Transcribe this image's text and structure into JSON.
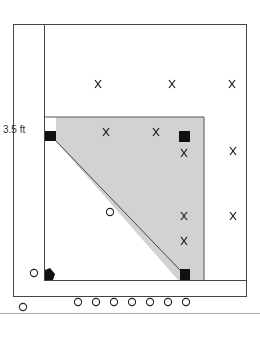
{
  "diagram": {
    "label": "3.5 ft",
    "colors": {
      "line": "#444444",
      "shade": "#d2d2d2",
      "marker": "#111111",
      "separator": "#aaaaaa"
    },
    "x_marks": [
      {
        "x": 98,
        "y": 84
      },
      {
        "x": 172,
        "y": 84
      },
      {
        "x": 232,
        "y": 84
      },
      {
        "x": 106,
        "y": 132
      },
      {
        "x": 156,
        "y": 132
      },
      {
        "x": 184,
        "y": 153
      },
      {
        "x": 233,
        "y": 151
      },
      {
        "x": 184,
        "y": 216
      },
      {
        "x": 233,
        "y": 216
      },
      {
        "x": 184,
        "y": 241
      }
    ],
    "circles": [
      {
        "x": 110,
        "y": 212
      },
      {
        "x": 34,
        "y": 273
      },
      {
        "x": 23,
        "y": 307
      },
      {
        "x": 78,
        "y": 302
      },
      {
        "x": 96,
        "y": 302
      },
      {
        "x": 114,
        "y": 302
      },
      {
        "x": 132,
        "y": 302
      },
      {
        "x": 150,
        "y": 302
      },
      {
        "x": 168,
        "y": 302
      },
      {
        "x": 186,
        "y": 302
      }
    ],
    "squares": [
      {
        "x": 50,
        "y": 136
      },
      {
        "x": 185,
        "y": 136
      },
      {
        "x": 185,
        "y": 274
      }
    ]
  }
}
